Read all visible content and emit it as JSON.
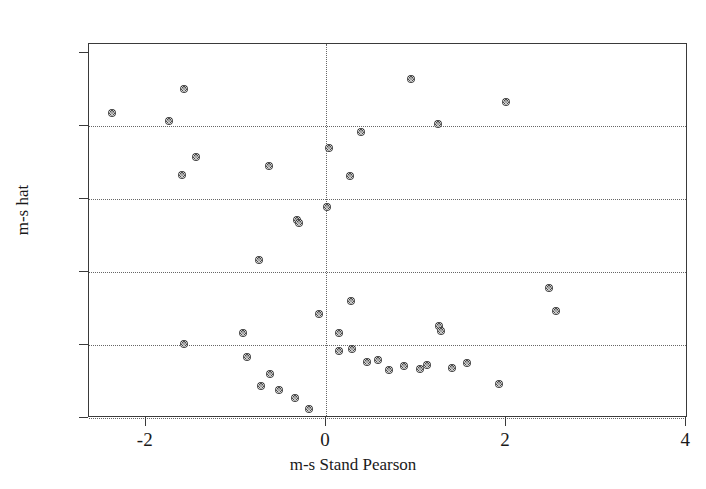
{
  "chart_data": {
    "type": "scatter",
    "title": "",
    "xlabel": "m-s Stand Pearson",
    "ylabel": "m-s hat",
    "xlim": [
      -2.63,
      4.02
    ],
    "ylim": [
      0.0,
      0.513
    ],
    "grid": true,
    "legend": null,
    "x_ticks": [
      -2,
      0,
      2,
      4
    ],
    "x_tick_labels": [
      "-2",
      "0",
      "2",
      "4"
    ],
    "y_ticks": [
      0,
      0.1,
      0.2,
      0.3,
      0.4,
      0.5
    ],
    "y_tick_labels": [
      "0",
      ".1",
      ".2",
      ".3",
      ".4",
      ".5"
    ],
    "gridlines_y": [
      0,
      0.1,
      0.2,
      0.3,
      0.4
    ],
    "gridlines_x": [
      0
    ],
    "marker": "filled-circle",
    "marker_color": "#4a4a4a",
    "n_points": 42,
    "x": [
      -2.38,
      -1.74,
      -1.58,
      -1.44,
      -1.6,
      -0.63,
      -0.74,
      -0.92,
      -0.88,
      -0.72,
      -0.62,
      -0.52,
      -0.34,
      -0.19,
      -0.32,
      -0.3,
      -0.08,
      0.01,
      0.03,
      0.15,
      0.14,
      0.27,
      0.29,
      0.28,
      0.39,
      0.46,
      0.58,
      0.7,
      0.87,
      0.95,
      1.05,
      1.12,
      1.25,
      1.26,
      1.28,
      1.4,
      1.57,
      1.92,
      2.0,
      2.48,
      2.56,
      -1.58
    ],
    "y": [
      0.418,
      0.408,
      0.451,
      0.358,
      0.333,
      0.345,
      0.217,
      0.117,
      0.083,
      0.044,
      0.061,
      0.039,
      0.027,
      0.013,
      0.272,
      0.268,
      0.142,
      0.289,
      0.37,
      0.117,
      0.092,
      0.332,
      0.095,
      0.16,
      0.392,
      0.077,
      0.08,
      0.066,
      0.072,
      0.465,
      0.067,
      0.073,
      0.403,
      0.126,
      0.119,
      0.068,
      0.075,
      0.047,
      0.433,
      0.178,
      0.147,
      0.102
    ]
  }
}
